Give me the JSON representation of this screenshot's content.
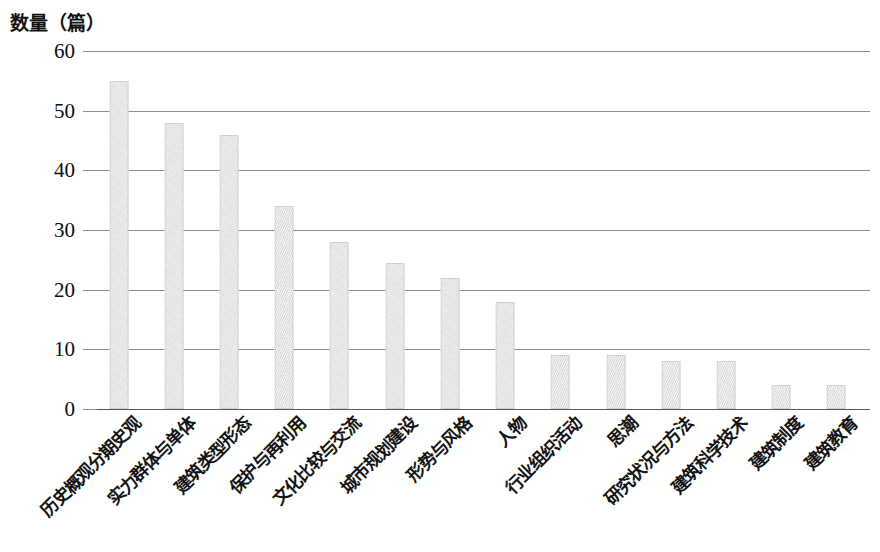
{
  "chart_data": {
    "type": "bar",
    "title": "",
    "ylabel": "数量（篇）",
    "xlabel": "",
    "ylim": [
      0,
      60
    ],
    "yticks": [
      0,
      10,
      20,
      30,
      40,
      50,
      60
    ],
    "grid": true,
    "legend": null,
    "orientation": "vertical",
    "bar_color": "#e3e3e3",
    "categories": [
      "历史概观分期史观",
      "实力群体与单体",
      "建筑类型形态",
      "保护与再利用",
      "文化比较与交流",
      "城市规划建设",
      "形势与风格",
      "人物",
      "行业组织活动",
      "思潮",
      "研究状况与方法",
      "建筑科学技术",
      "建筑制度",
      "建筑教育"
    ],
    "values": [
      55,
      48,
      46,
      34,
      28,
      24.5,
      22,
      18,
      9,
      9,
      8,
      8,
      4,
      4
    ]
  },
  "axis": {
    "y_title": "数量（篇）",
    "y_tick_labels": [
      "60",
      "50",
      "40",
      "30",
      "20",
      "10",
      "0"
    ]
  }
}
